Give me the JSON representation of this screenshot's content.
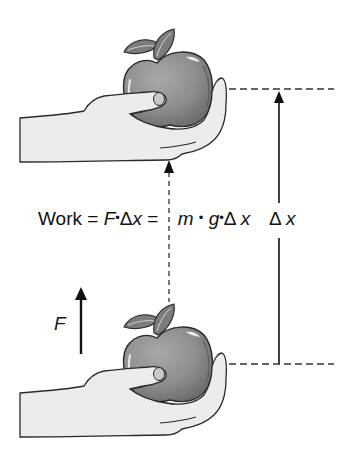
{
  "figure": {
    "equation": {
      "work_label": "Work",
      "equals_1": "=",
      "force_symbol": "F",
      "dot": "•",
      "delta": "Δ",
      "x_symbol": "x",
      "equals_2": "=",
      "mass_symbol": "m",
      "gravity_symbol": "g"
    },
    "displacement_label": {
      "delta": "Δ",
      "x_symbol": "x"
    },
    "force_label": "F",
    "colors": {
      "apple_fill": "#8e8e8e",
      "apple_shadow": "#6f6f6f",
      "apple_highlight": "#e6e6e6",
      "leaf_fill": "#7c7c7c",
      "hand_fill": "#ececec",
      "outline": "#2a2a2a",
      "arrow": "#111111",
      "dashed": "#333333"
    }
  }
}
